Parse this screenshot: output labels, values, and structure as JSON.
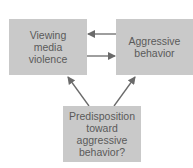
{
  "diagram": {
    "nodes": [
      {
        "id": "viewing",
        "lines": [
          "Viewing",
          "media",
          "violence"
        ]
      },
      {
        "id": "aggressive",
        "lines": [
          "Aggressive",
          "behavior"
        ]
      },
      {
        "id": "predisposition",
        "lines": [
          "Predisposition",
          "toward",
          "aggressive",
          "behavior?"
        ]
      }
    ],
    "edges": [
      {
        "from": "aggressive",
        "to": "viewing"
      },
      {
        "from": "viewing",
        "to": "aggressive"
      },
      {
        "from": "predisposition",
        "to": "viewing"
      },
      {
        "from": "predisposition",
        "to": "aggressive"
      }
    ],
    "colors": {
      "box": "#c9c9c9",
      "text": "#5a5a5a",
      "arrow": "#6a6a6a"
    }
  }
}
